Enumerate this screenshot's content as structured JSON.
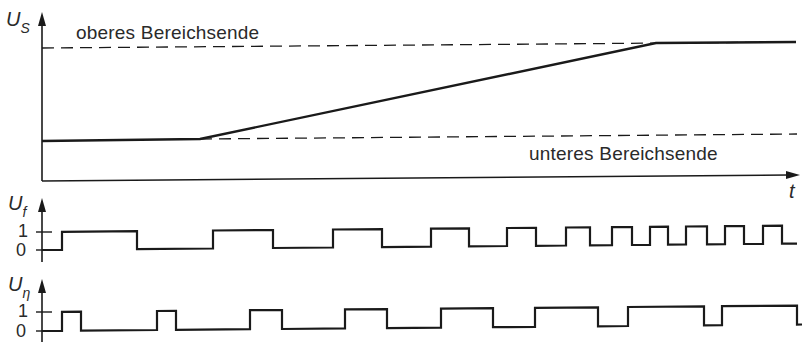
{
  "chart_data": {
    "type": "line",
    "title": "",
    "colors": {
      "line": "#1a1a1a",
      "text": "#2a2a2a",
      "background": "#ffffff"
    },
    "panels": [
      {
        "id": "us",
        "ylabel_main": "U",
        "ylabel_sub": "S",
        "xlabel": "t",
        "annotations": [
          "oberes Bereichsende",
          "unteres Bereichsende"
        ],
        "thresholds": [
          {
            "name": "oberes Bereichsende",
            "style": "dashed",
            "level": "upper"
          },
          {
            "name": "unteres Bereichsende",
            "style": "dashed",
            "level": "lower"
          }
        ],
        "series": [
          {
            "name": "U_S",
            "shape": "constant low, linear ramp, constant high",
            "x": [
              0,
              0.21,
              0.81,
              1.0
            ],
            "y": [
              "lower",
              "lower",
              "upper",
              "upper"
            ]
          }
        ]
      },
      {
        "id": "uf",
        "ylabel_main": "U",
        "ylabel_sub": "f",
        "ticks": [
          "1",
          "0"
        ],
        "series": [
          {
            "name": "U_f",
            "type": "square",
            "edges_x": [
              62,
              137,
              213,
              273,
              333,
              382,
              431,
              469,
              507,
              536,
              566,
              590,
              612,
              632,
              650,
              668,
              686,
              707,
              725,
              744,
              763,
              782
            ],
            "start_level": 0,
            "end_x": 797
          }
        ]
      },
      {
        "id": "ueta",
        "ylabel_main": "U",
        "ylabel_sub": "η",
        "ticks": [
          "1",
          "0"
        ],
        "series": [
          {
            "name": "U_η",
            "type": "pwm",
            "edges_x": [
              62,
              81,
              157,
              176,
              250,
              282,
              345,
              387,
              441,
              493,
              535,
              598,
              628,
              704,
              722,
              797
            ],
            "start_level": 0,
            "end_x": 802
          }
        ]
      }
    ]
  },
  "labels": {
    "us_main": "U",
    "us_sub": "S",
    "upper_limit": "oberes Bereichsende",
    "lower_limit": "unteres Bereichsende",
    "time_axis": "t",
    "uf_main": "U",
    "uf_sub": "f",
    "ueta_main": "U",
    "ueta_sub": "η",
    "tick_one": "1",
    "tick_zero": "0"
  }
}
